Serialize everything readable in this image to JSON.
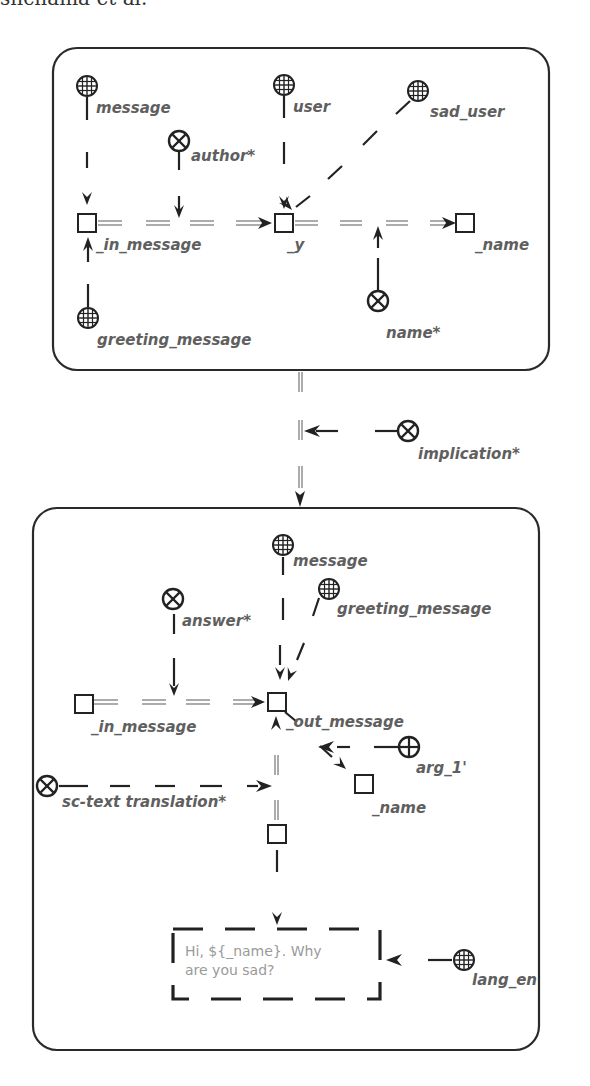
{
  "header": {
    "running_text": "shchama et al."
  },
  "top_box": {
    "nodes": {
      "message": "message",
      "author": "author*",
      "user": "user",
      "sad_user": "sad_user",
      "in_message": "_in_message",
      "y": "_y",
      "name_var": "_name",
      "greeting_message": "greeting_message",
      "name_rel": "name*"
    }
  },
  "connector": {
    "implication": "implication*"
  },
  "bottom_box": {
    "nodes": {
      "message": "message",
      "greeting_message": "greeting_message",
      "answer": "answer*",
      "in_message": "_in_message",
      "out_message": "_out_message",
      "arg_1": "arg_1'",
      "name_var": "_name",
      "translation": "sc-text translation*",
      "lang_en": "lang_en"
    },
    "link_content": {
      "line1": "Hi, ${_name}. Why",
      "line2": "are you sad?"
    }
  },
  "icons": {
    "class_node": "globe-grid-icon",
    "relation_node": "circled-x-icon",
    "role_node": "circled-plus-icon",
    "var_node": "square-icon"
  }
}
